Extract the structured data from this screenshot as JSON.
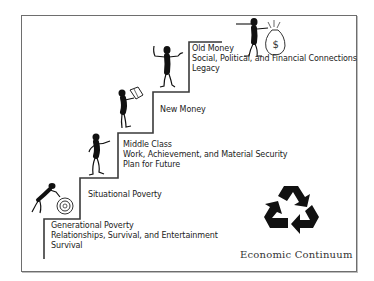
{
  "diagram": {
    "title": "Economic Continuum",
    "steps": [
      {
        "name": "Generational Poverty",
        "lines": [
          "Generational Poverty",
          "Relationships, Survival, and Entertainment",
          "Survival"
        ]
      },
      {
        "name": "Situational Poverty",
        "lines": [
          "Situational Poverty"
        ]
      },
      {
        "name": "Middle Class",
        "lines": [
          "Middle Class",
          "Work, Achievement, and Material Security",
          "Plan for Future"
        ]
      },
      {
        "name": "New Money",
        "lines": [
          "New Money"
        ]
      },
      {
        "name": "Old Money",
        "lines": [
          "Old Money",
          "Social, Political, and Financial Connections",
          "Legacy"
        ]
      }
    ],
    "icons": {
      "figure_1": "person-pushing-wheel-icon",
      "figure_2": "person-walking-icon",
      "figure_3": "person-reading-icon",
      "figure_4": "person-celebrating-icon",
      "figure_5": "person-with-money-bag-icon",
      "money_bag_symbol": "$",
      "recycle": "recycle-icon"
    },
    "colors": {
      "line": "#3a3a3a",
      "frame": "#6e6e6e",
      "figure": "#111111",
      "text": "#222222"
    }
  }
}
